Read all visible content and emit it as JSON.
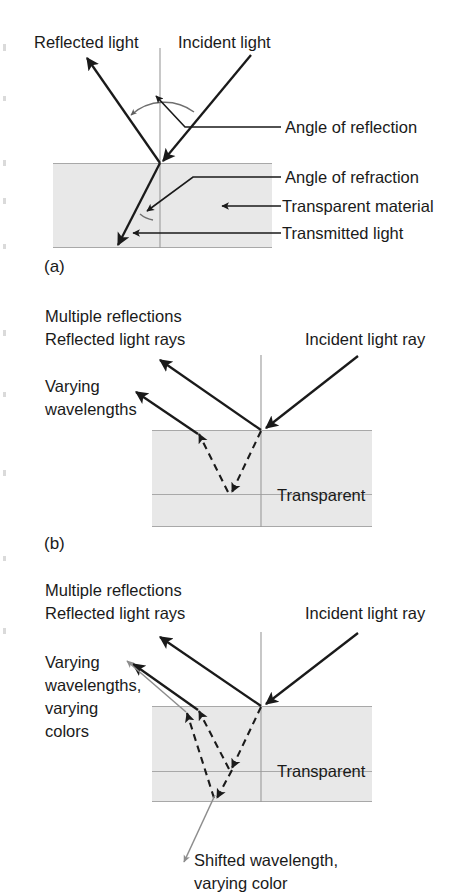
{
  "figure": {
    "background_color": "#ffffff",
    "material_fill_color": "#e8e8e8",
    "material_edge_color": "#a8a8a8",
    "ray_color": "#1a1a1a",
    "normal_line_color": "#9a9a9a",
    "thin_ray_color": "#8d8d8d"
  },
  "panels": [
    {
      "id": "panel-a",
      "letter": "(a)",
      "material_label": "",
      "labels": {
        "reflected_light": "Reflected light",
        "incident_light": "Incident light",
        "angle_of_reflection": "Angle of reflection",
        "angle_of_refraction": "Angle of refraction",
        "transparent_material": "Transparent material",
        "transmitted_light": "Transmitted light"
      }
    },
    {
      "id": "panel-b",
      "letter": "(b)",
      "material_label": "Transparent",
      "labels": {
        "multiple_reflections": "Multiple reflections",
        "reflected_light_rays": "Reflected light rays",
        "incident_light_ray": "Incident light ray",
        "varying_line1": "Varying",
        "varying_line2": "wavelengths"
      }
    },
    {
      "id": "panel-c",
      "letter": "",
      "material_label": "Transparent",
      "labels": {
        "multiple_reflections": "Multiple reflections",
        "reflected_light_rays": "Reflected light rays",
        "incident_light_ray": "Incident light ray",
        "varying_line1": "Varying",
        "varying_line2": "wavelengths,",
        "varying_line3": "varying",
        "varying_line4": "colors",
        "shifted_line1": "Shifted wavelength,",
        "shifted_line2": "varying color"
      }
    }
  ]
}
